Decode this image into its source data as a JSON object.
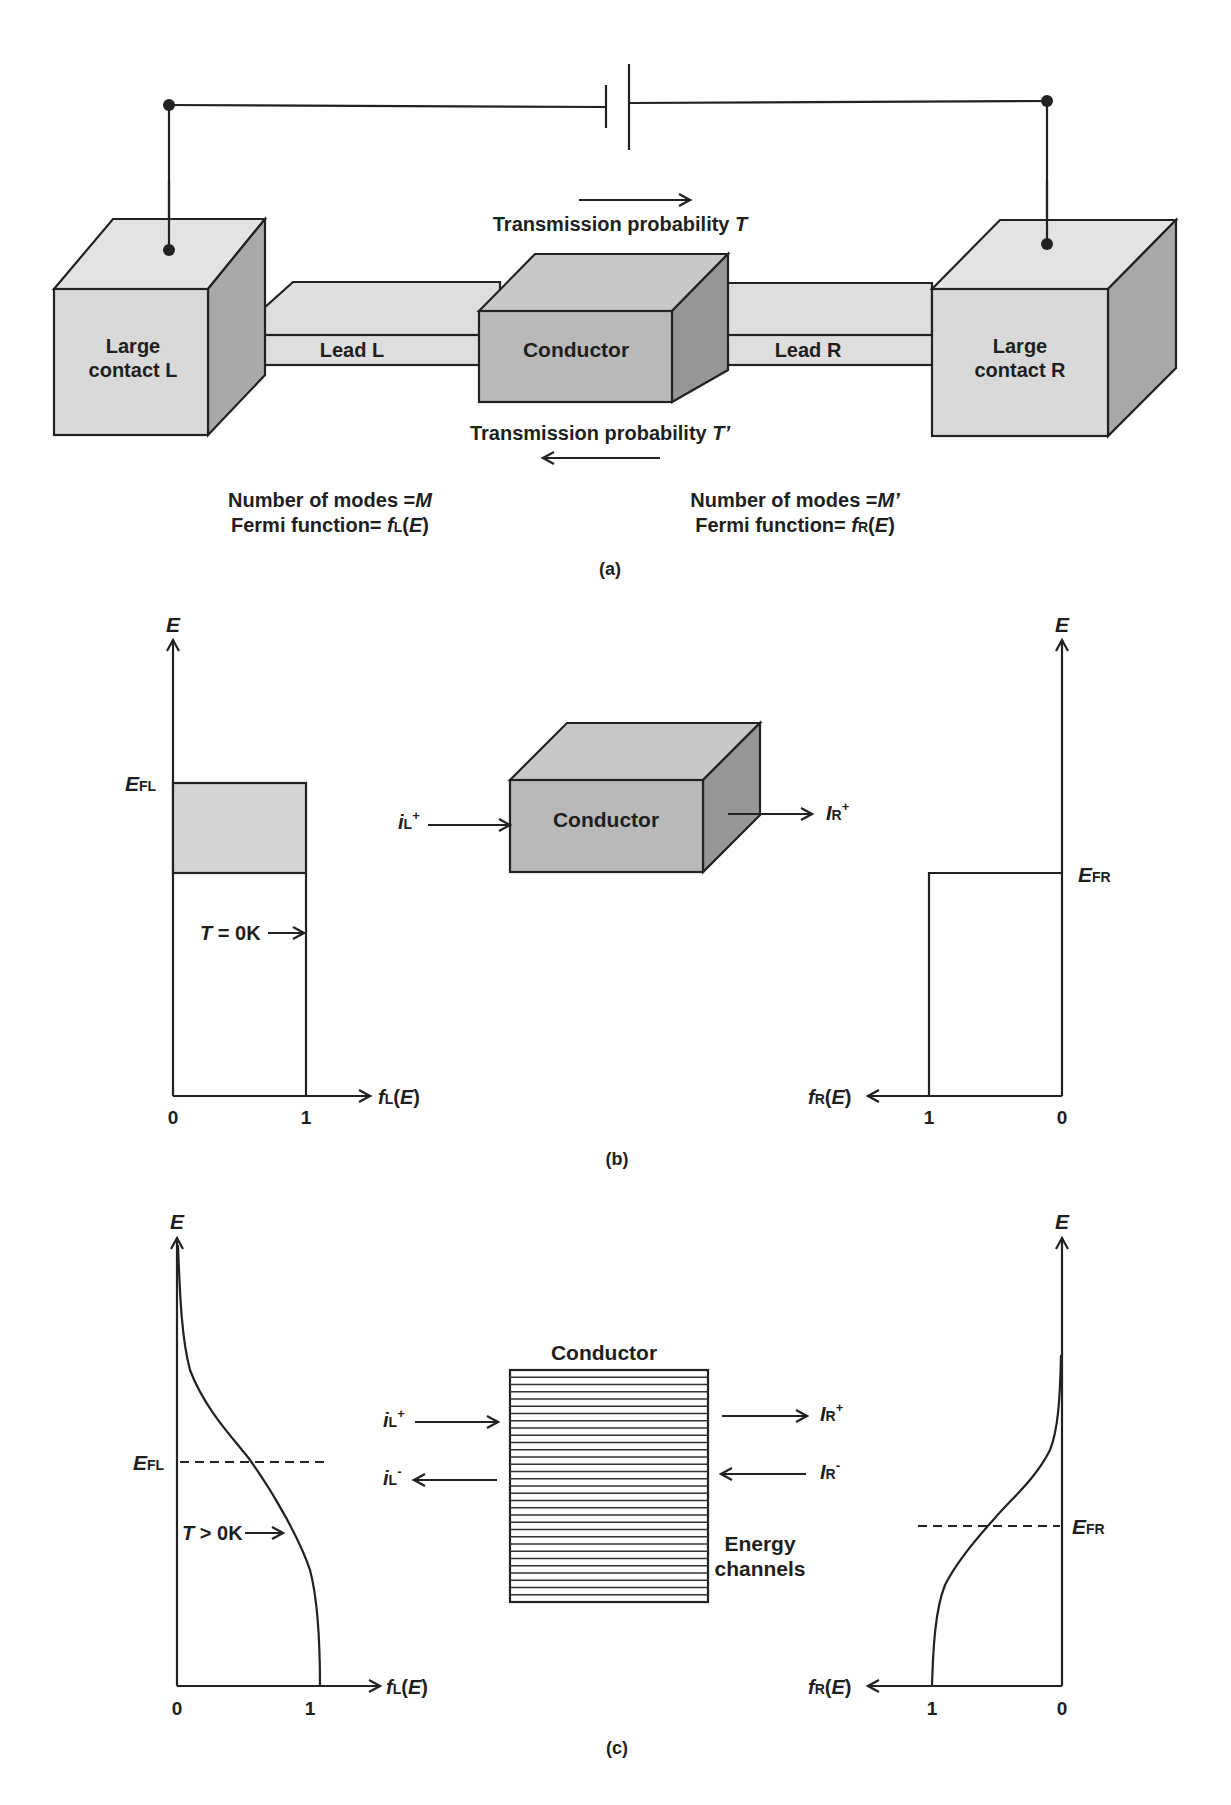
{
  "panel_a": {
    "caption": "(a)",
    "contact_left": {
      "line1": "Large",
      "line2": "contact L"
    },
    "contact_right": {
      "line1": "Large",
      "line2": "contact R"
    },
    "lead_left": "Lead L",
    "lead_right": "Lead R",
    "conductor": "Conductor",
    "transmission_forward": {
      "text": "Transmission probability ",
      "symbol": "T"
    },
    "transmission_backward": {
      "text": "Transmission probability ",
      "symbol": "T’"
    },
    "left_info": {
      "modes_text": "Number of modes =",
      "modes_symbol": "M",
      "fermi_text": "Fermi function= ",
      "fermi_f": "f",
      "fermi_sub": "L",
      "fermi_arg": "E"
    },
    "right_info": {
      "modes_text": "Number of modes =",
      "modes_symbol": "M’",
      "fermi_text": "Fermi function= ",
      "fermi_f": "f",
      "fermi_sub": "R",
      "fermi_arg": "E"
    }
  },
  "panel_b": {
    "caption": "(b)",
    "axis_E": "E",
    "left": {
      "fermi_label": "E",
      "fermi_sub": "FL",
      "temp_symbol": "T",
      "temp_text": " = 0K",
      "x_f": "f",
      "x_sub": "L",
      "x_arg": "E",
      "tick0": "0",
      "tick1": "1"
    },
    "right": {
      "fermi_label": "E",
      "fermi_sub": "FR",
      "x_f": "f",
      "x_sub": "R",
      "x_arg": "E",
      "tick1": "1",
      "tick0": "0"
    },
    "conductor": "Conductor",
    "current_in": {
      "sym": "i",
      "sub": "L",
      "sup": "+"
    },
    "current_out": {
      "sym": "I",
      "sub": "R",
      "sup": "+"
    }
  },
  "panel_c": {
    "caption": "(c)",
    "axis_E": "E",
    "left": {
      "fermi_label": "E",
      "fermi_sub": "FL",
      "temp_symbol": "T",
      "temp_text": " > 0K",
      "x_f": "f",
      "x_sub": "L",
      "x_arg": "E",
      "tick0": "0",
      "tick1": "1"
    },
    "right": {
      "fermi_label": "E",
      "fermi_sub": "FR",
      "x_f": "f",
      "x_sub": "R",
      "x_arg": "E",
      "tick1": "1",
      "tick0": "0"
    },
    "conductor": "Conductor",
    "channels_line1": "Energy",
    "channels_line2": "channels",
    "iL_plus": {
      "sym": "i",
      "sub": "L",
      "sup": "+"
    },
    "iL_minus": {
      "sym": "i",
      "sub": "L",
      "sup": "-"
    },
    "IR_plus": {
      "sym": "I",
      "sub": "R",
      "sup": "+"
    },
    "IR_minus": {
      "sym": "I",
      "sub": "R",
      "sup": "-"
    },
    "channel_count": 32
  }
}
